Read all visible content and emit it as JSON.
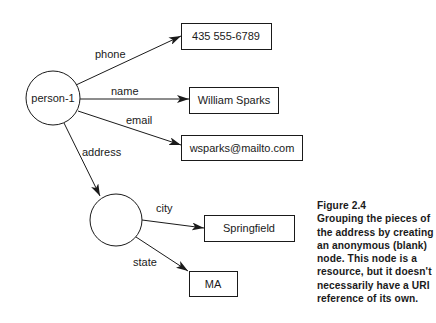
{
  "nodes": {
    "person": {
      "label": "person-1",
      "shape": "circle"
    },
    "blank": {
      "label": "",
      "shape": "circle"
    },
    "phone": {
      "label": "435 555-6789",
      "shape": "box"
    },
    "name": {
      "label": "William Sparks",
      "shape": "box"
    },
    "email": {
      "label": "wsparks@mailto.com",
      "shape": "box"
    },
    "city": {
      "label": "Springfield",
      "shape": "box"
    },
    "state": {
      "label": "MA",
      "shape": "box"
    }
  },
  "edges": {
    "phone": {
      "label": "phone",
      "from": "person",
      "to": "phone"
    },
    "name": {
      "label": "name",
      "from": "person",
      "to": "name"
    },
    "email": {
      "label": "email",
      "from": "person",
      "to": "email"
    },
    "address": {
      "label": "address",
      "from": "person",
      "to": "blank"
    },
    "city": {
      "label": "city",
      "from": "blank",
      "to": "city"
    },
    "state": {
      "label": "state",
      "from": "blank",
      "to": "state"
    }
  },
  "caption": {
    "title": "Figure 2.4",
    "lines": [
      "Grouping the pieces of",
      "the address by creating",
      "an anonymous (blank)",
      "node. This node is a",
      "resource, but it doesn't",
      "necessarily have a URI",
      "reference of its own."
    ]
  }
}
